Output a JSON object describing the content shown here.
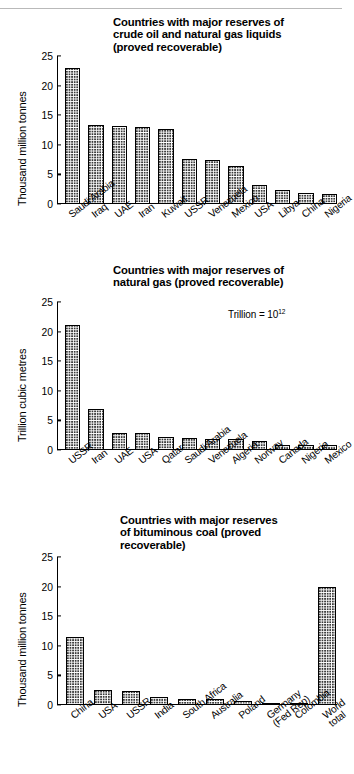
{
  "page": {
    "background": "#ffffff",
    "ink": "#000000",
    "rule_color": "#b9b9b9"
  },
  "charts": [
    {
      "id": "crude-oil",
      "title": "Countries with major reserves of\ncrude oil and natural gas liquids\n(proved recoverable)",
      "ylabel": "Thousand million tonnes",
      "note": "",
      "chart_data": {
        "type": "bar",
        "title": "Countries with major reserves of crude oil and natural gas liquids (proved recoverable)",
        "xlabel": "",
        "ylabel": "Thousand million tonnes",
        "ylim": [
          0,
          25
        ],
        "yticks": [
          0,
          5,
          10,
          15,
          20,
          25
        ],
        "grid": false,
        "legend": "none",
        "categories": [
          "Saudi Arabia",
          "Iraq",
          "UAE",
          "Iran",
          "Kuwait",
          "USSR",
          "Venezuela",
          "Mexico",
          "USA",
          "Libya",
          "China",
          "Nigeria"
        ],
        "values": [
          23.0,
          13.4,
          13.2,
          13.0,
          12.6,
          7.6,
          7.4,
          6.4,
          3.2,
          2.3,
          1.8,
          1.7
        ]
      }
    },
    {
      "id": "natural-gas",
      "title": "Countries with major reserves of\nnatural gas (proved recoverable)",
      "ylabel": "Trillion cubic metres",
      "note": "Trillion = 10",
      "note_sup": "12",
      "chart_data": {
        "type": "bar",
        "title": "Countries with major reserves of natural gas (proved recoverable)",
        "xlabel": "",
        "ylabel": "Trillion cubic metres",
        "ylim": [
          0,
          25
        ],
        "yticks": [
          0,
          5,
          10,
          15,
          20,
          25
        ],
        "grid": false,
        "legend": "none",
        "annotation": "Trillion = 10^12",
        "categories": [
          "USSR",
          "Iran",
          "UAE",
          "USA",
          "Qatar",
          "Saudi Arabia",
          "Venezuela",
          "Algeria",
          "Norway",
          "Canada",
          "Nigeria",
          "Mexico"
        ],
        "values": [
          21.2,
          7.0,
          2.9,
          2.8,
          2.2,
          2.1,
          1.8,
          1.8,
          1.6,
          0.9,
          0.85,
          0.9
        ]
      }
    },
    {
      "id": "bituminous-coal",
      "title": "Countries with major reserves\nof bituminous coal (proved\nrecoverable)",
      "ylabel": "Thousand million tonnes",
      "note": "",
      "chart_data": {
        "type": "bar",
        "title": "Countries with major reserves of bituminous coal (proved recoverable)",
        "xlabel": "",
        "ylabel": "Thousand million tonnes",
        "ylim": [
          0,
          25
        ],
        "yticks": [
          0,
          5,
          10,
          15,
          20,
          25
        ],
        "grid": false,
        "legend": "none",
        "categories": [
          "China",
          "USA",
          "USSR",
          "India",
          "South Africa",
          "Australia",
          "Poland",
          "Germany\n(Fed Rep)",
          "Colombia",
          "World total"
        ],
        "values": [
          11.5,
          2.5,
          2.4,
          1.4,
          1.1,
          1.1,
          0.6,
          0.3,
          0.3,
          20.0
        ]
      }
    }
  ]
}
